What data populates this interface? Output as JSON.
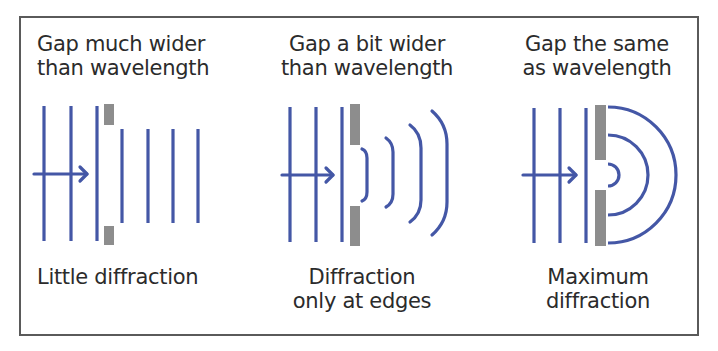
{
  "colors": {
    "wave": "#4457a6",
    "barrier": "#8d8d8d",
    "text": "#2b2b2b",
    "frame": "#5a5a5a"
  },
  "panels": [
    {
      "id": "wide-gap",
      "title_line1": "Gap much wider",
      "title_line2": "than wavelength",
      "caption_line1": "Little diffraction",
      "caption_line2": ""
    },
    {
      "id": "slightly-wider-gap",
      "title_line1": "Gap a bit wider",
      "title_line2": "than wavelength",
      "caption_line1": "Diffraction",
      "caption_line2": "only at edges"
    },
    {
      "id": "equal-gap",
      "title_line1": "Gap the same",
      "title_line2": "as wavelength",
      "caption_line1": "Maximum",
      "caption_line2": "diffraction"
    }
  ]
}
